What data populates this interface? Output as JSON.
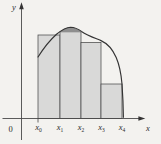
{
  "axes": {
    "y_label": "y",
    "x_label": "x",
    "origin_label": "0",
    "x_ticks": [
      {
        "base": "x",
        "sub": "0",
        "x": 38.5
      },
      {
        "base": "x",
        "sub": "1",
        "x": 60
      },
      {
        "base": "x",
        "sub": "2",
        "x": 81
      },
      {
        "base": "x",
        "sub": "3",
        "x": 101.5
      },
      {
        "base": "x",
        "sub": "4",
        "x": 122
      }
    ]
  },
  "colors": {
    "background": "#f3f2ef",
    "rect_fill": "#d9d9d8",
    "rect_stroke": "#4a4a4a",
    "curve": "#343434",
    "lens_fill": "#8f8f8f",
    "axis": "#4a4a4a",
    "text": "#2b2b2b"
  },
  "figure": {
    "rects": [
      {
        "x": 38,
        "y": 35,
        "w": 22,
        "h": 83.5
      },
      {
        "x": 60,
        "y": 31.8,
        "w": 21,
        "h": 86.7
      },
      {
        "x": 81,
        "y": 42.5,
        "w": 20,
        "h": 76
      },
      {
        "x": 101,
        "y": 84,
        "w": 21,
        "h": 34.5
      }
    ],
    "curve_path": "M 38 57 C 44 47.5, 50 40, 56.5 34.2 C 61 30.6, 66 27.3, 70.5 27.2 C 75 27.3, 78.6 29.2, 81.5 31.4 C 88 35.8, 95.5 38.2, 101 40.6 C 107.5 43.5, 112.5 49, 116.2 57.5 C 119 64, 121 72, 122 84 C 122.8 95.5, 123.3 106, 123.4 117.3",
    "lens_path": "M 60 31.6 C 64 28.4, 67 27.15, 70.5 27.15 C 74.5 27.15, 78 28.8, 81 31.45 L 81 31.95 L 60 31.95 Z"
  }
}
